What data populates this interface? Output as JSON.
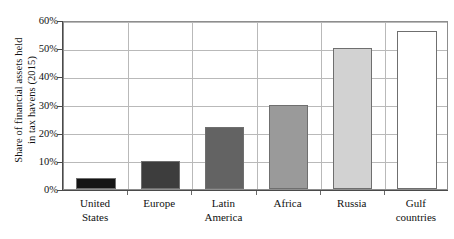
{
  "chart_data": {
    "type": "bar",
    "title": "",
    "xlabel": "",
    "ylabel": "Share of financial assets held in tax havens (2015)",
    "ylabel_lines": [
      "Share of financial assets held",
      "in tax havens (2015)"
    ],
    "categories": [
      "United States",
      "Europe",
      "Latin America",
      "Africa",
      "Russia",
      "Gulf countries"
    ],
    "category_lines": [
      [
        "United",
        "States"
      ],
      [
        "Europe"
      ],
      [
        "Latin",
        "America"
      ],
      [
        "Africa"
      ],
      [
        "Russia"
      ],
      [
        "Gulf",
        "countries"
      ]
    ],
    "values": [
      4,
      10,
      22,
      30,
      50,
      56
    ],
    "unit": "%",
    "ylim": [
      0,
      60
    ],
    "ytick_values": [
      0,
      10,
      20,
      30,
      40,
      50,
      60
    ],
    "ytick_labels": [
      "0%",
      "10%",
      "20%",
      "30%",
      "40%",
      "50%",
      "60%"
    ],
    "grid": true,
    "grid_axis": "y",
    "legend": "none",
    "bar_colors": [
      "#151515",
      "#3d3d3d",
      "#636363",
      "#9a9a9a",
      "#d2d2d2",
      "#ffffff"
    ],
    "bar_border_color": "#6f6f6f",
    "gridline_color": "#b9b9b9",
    "frame_color": "#8d8d8d",
    "axis_color": "#4a4a4a",
    "background_color": "#ffffff",
    "text_color": "#111111"
  }
}
